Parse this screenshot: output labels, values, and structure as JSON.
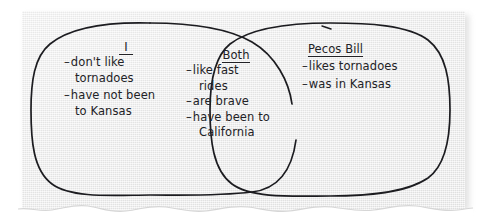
{
  "document": {
    "type": "venn-diagram-worksheet",
    "background_color": "#ffffff",
    "paper_color": "#eaeaea",
    "ink_color": "#1c1c20"
  },
  "venn": {
    "left": {
      "heading": "I",
      "items": [
        {
          "bullet": "–",
          "lines": [
            "don't like",
            "tornadoes"
          ]
        },
        {
          "bullet": "–",
          "lines": [
            "have not been",
            "to Kansas"
          ]
        }
      ]
    },
    "center": {
      "heading": "Both",
      "items": [
        {
          "bullet": "–",
          "lines": [
            "like fast",
            "rides"
          ]
        },
        {
          "bullet": "–",
          "lines": [
            "are brave"
          ]
        },
        {
          "bullet": "–",
          "lines": [
            "have been to",
            "California"
          ]
        }
      ]
    },
    "right": {
      "heading": "Pecos Bill",
      "items": [
        {
          "bullet": "–",
          "lines": [
            "likes tornadoes"
          ]
        },
        {
          "bullet": "–",
          "lines": [
            "was in Kansas"
          ]
        }
      ]
    }
  }
}
